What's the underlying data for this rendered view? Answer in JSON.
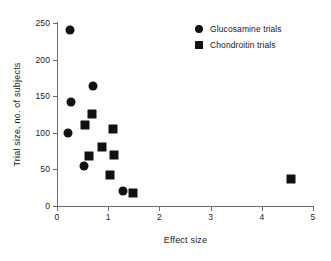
{
  "chart_data": {
    "type": "scatter",
    "title": "",
    "xlabel": "Effect size",
    "ylabel": "Trial size, no. of subjects",
    "xlim": [
      0,
      5
    ],
    "ylim": [
      0,
      250
    ],
    "xticks": [
      0,
      1,
      2,
      3,
      4,
      5
    ],
    "xtick_labels": [
      "0",
      "1",
      "2",
      "3",
      "4",
      "5"
    ],
    "yticks": [
      0,
      50,
      100,
      150,
      200,
      250
    ],
    "ytick_labels": [
      "0",
      "50",
      "100",
      "150",
      "200",
      "250"
    ],
    "grid": false,
    "legend_position": "top-right",
    "series": [
      {
        "name": "Glucosamine trials",
        "marker": "circle",
        "color": "#111111",
        "points": [
          {
            "x": 0.26,
            "y": 240
          },
          {
            "x": 0.27,
            "y": 142
          },
          {
            "x": 0.22,
            "y": 100
          },
          {
            "x": 0.7,
            "y": 164
          },
          {
            "x": 0.52,
            "y": 55
          },
          {
            "x": 1.28,
            "y": 21
          }
        ]
      },
      {
        "name": "Chondroitin trials",
        "marker": "square",
        "color": "#111111",
        "points": [
          {
            "x": 0.68,
            "y": 126
          },
          {
            "x": 0.55,
            "y": 111
          },
          {
            "x": 1.1,
            "y": 105
          },
          {
            "x": 0.87,
            "y": 80
          },
          {
            "x": 0.62,
            "y": 68
          },
          {
            "x": 1.12,
            "y": 69
          },
          {
            "x": 1.03,
            "y": 43
          },
          {
            "x": 1.48,
            "y": 18
          },
          {
            "x": 4.58,
            "y": 37
          }
        ]
      }
    ]
  },
  "legend": {
    "entries": [
      {
        "label": "Glucosamine trials",
        "marker": "circle"
      },
      {
        "label": "Chondroitin trials",
        "marker": "square"
      }
    ]
  }
}
